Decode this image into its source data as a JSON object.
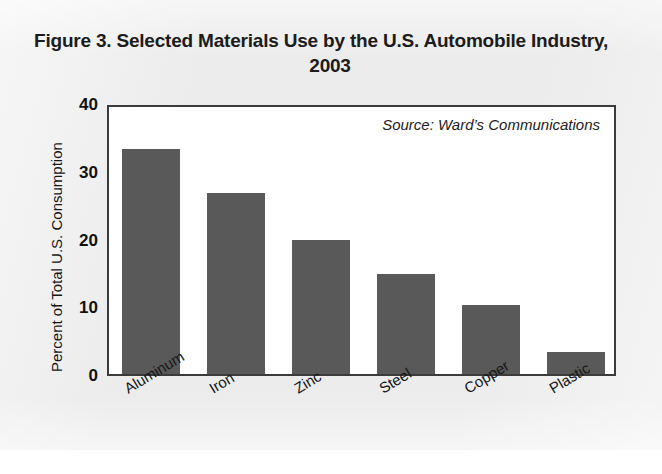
{
  "figure": {
    "title": "Figure 3. Selected Materials Use by the U.S. Automobile Industry, 2003",
    "source_note": "Source: Ward’s Communications"
  },
  "colors": {
    "bar_fill": "#595959",
    "axis": "#3b3b3b",
    "text": "#161616",
    "page_background": "#ececec",
    "plot_background": "#ffffff"
  },
  "chart_data": {
    "type": "bar",
    "title": "Figure 3. Selected Materials Use by the U.S. Automobile Industry, 2003",
    "subtitle": "",
    "xlabel": "",
    "ylabel": "Percent of Total U.S. Consumption",
    "categories": [
      "Aluminum",
      "Iron",
      "Zinc",
      "Steel",
      "Copper",
      "Plastic"
    ],
    "values": [
      33.2,
      26.7,
      19.8,
      14.8,
      10.2,
      3.3
    ],
    "ylim": [
      0,
      40
    ],
    "yticks": [
      0,
      10,
      20,
      30,
      40
    ],
    "ytick_labels": [
      "0",
      "10",
      "20",
      "30",
      "40"
    ],
    "grid": false,
    "legend": false,
    "legend_position": "none",
    "annotations": [
      "Source: Ward’s Communications"
    ],
    "xtick_label_rotation": -31
  }
}
